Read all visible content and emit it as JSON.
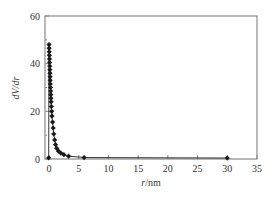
{
  "chart_data": {
    "type": "line",
    "title": "",
    "xlabel": "r/nm",
    "xlabel_italic": "r",
    "xlabel_unit": "/nm",
    "ylabel": "dV/dr",
    "xlim": [
      -1,
      35
    ],
    "ylim": [
      0,
      60
    ],
    "xticks": [
      0,
      5,
      10,
      15,
      20,
      25,
      30,
      35
    ],
    "yticks": [
      0,
      20,
      40,
      60
    ],
    "grid": false,
    "legend": null,
    "marker": "diamond",
    "series": [
      {
        "name": "dV/dr",
        "color": "#1a1a1a",
        "points": [
          [
            -0.05,
            0.5
          ],
          [
            0.0,
            48.0
          ],
          [
            0.02,
            46.5
          ],
          [
            0.04,
            45.0
          ],
          [
            0.06,
            43.5
          ],
          [
            0.08,
            42.0
          ],
          [
            0.1,
            40.5
          ],
          [
            0.12,
            39.0
          ],
          [
            0.14,
            37.5
          ],
          [
            0.16,
            36.0
          ],
          [
            0.18,
            34.5
          ],
          [
            0.2,
            33.0
          ],
          [
            0.22,
            31.5
          ],
          [
            0.25,
            30.0
          ],
          [
            0.28,
            28.5
          ],
          [
            0.3,
            27.0
          ],
          [
            0.33,
            25.5
          ],
          [
            0.36,
            24.0
          ],
          [
            0.4,
            22.0
          ],
          [
            0.45,
            20.0
          ],
          [
            0.5,
            18.0
          ],
          [
            0.6,
            15.5
          ],
          [
            0.7,
            13.0
          ],
          [
            0.8,
            10.5
          ],
          [
            0.95,
            8.0
          ],
          [
            1.1,
            6.0
          ],
          [
            1.3,
            4.5
          ],
          [
            1.6,
            3.3
          ],
          [
            2.0,
            2.5
          ],
          [
            2.5,
            1.8
          ],
          [
            3.3,
            1.2
          ],
          [
            5.9,
            0.6
          ],
          [
            30.0,
            0.4
          ]
        ]
      }
    ]
  }
}
